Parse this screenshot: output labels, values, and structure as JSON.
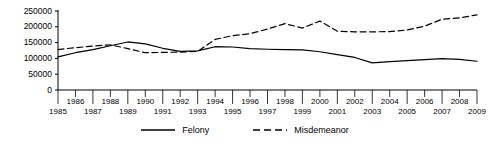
{
  "chart_data": {
    "type": "line",
    "title": "",
    "xlabel": "",
    "ylabel": "",
    "x": [
      1985,
      1986,
      1987,
      1988,
      1989,
      1990,
      1991,
      1992,
      1993,
      1994,
      1995,
      1996,
      1997,
      1998,
      1999,
      2000,
      2001,
      2002,
      2003,
      2004,
      2005,
      2006,
      2007,
      2008,
      2009
    ],
    "xlim": [
      1985,
      2009
    ],
    "ylim": [
      0,
      250000
    ],
    "yticks": [
      0,
      50000,
      100000,
      150000,
      200000,
      250000
    ],
    "ytick_labels": [
      "0",
      "50000",
      "100000",
      "150000",
      "200000",
      "250000"
    ],
    "xtick_labels_upper": [
      "1986",
      "1988",
      "1990",
      "1992",
      "1994",
      "1996",
      "1998",
      "2000",
      "2002",
      "2004",
      "2006",
      "2008"
    ],
    "xtick_labels_lower": [
      "1985",
      "1987",
      "1989",
      "1991",
      "1993",
      "1995",
      "1997",
      "1999",
      "2001",
      "2003",
      "2005",
      "2007",
      "2009"
    ],
    "grid": false,
    "legend_position": "bottom-center",
    "series": [
      {
        "name": "Felony",
        "style": "solid",
        "color": "#000000",
        "values": [
          105000,
          118000,
          128000,
          140000,
          152000,
          146000,
          132000,
          122000,
          124000,
          137000,
          136000,
          131000,
          129000,
          128000,
          127000,
          121000,
          112000,
          103000,
          86000,
          90000,
          93000,
          96000,
          99000,
          97000,
          91000
        ]
      },
      {
        "name": "Misdemeanor",
        "style": "dashed",
        "color": "#000000",
        "values": [
          128000,
          134000,
          139000,
          143000,
          131000,
          118000,
          119000,
          120000,
          122000,
          160000,
          172000,
          178000,
          193000,
          210000,
          196000,
          218000,
          186000,
          184000,
          184000,
          185000,
          190000,
          202000,
          224000,
          228000,
          238000
        ]
      }
    ]
  },
  "legend": {
    "items": [
      {
        "label": "Felony",
        "icon": "solid-line-swatch"
      },
      {
        "label": "Misdemeanor",
        "icon": "dashed-line-swatch"
      }
    ]
  },
  "colors": {
    "axis": "#000000",
    "series_felony": "#000000",
    "series_misdemeanor": "#000000",
    "background": "#ffffff"
  }
}
